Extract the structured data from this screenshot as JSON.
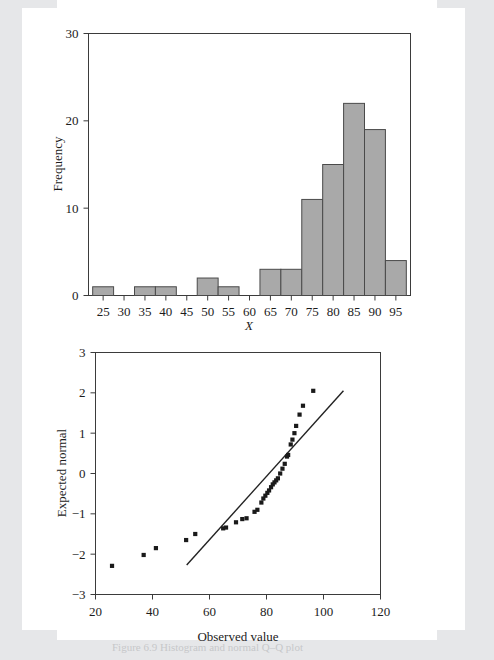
{
  "page": {
    "background_color": "#e6e7e9",
    "figure_background_color": "#ffffff",
    "caption_remnant": "Figure 6.9    Histogram and normal Q–Q plot"
  },
  "chart_data": [
    {
      "id": "histogram",
      "type": "bar",
      "title": "",
      "xlabel": "X",
      "ylabel": "Frequency",
      "categories": [
        25,
        30,
        35,
        40,
        45,
        50,
        55,
        60,
        65,
        70,
        75,
        80,
        85,
        90,
        95
      ],
      "values": [
        1,
        0,
        1,
        1,
        0,
        2,
        1,
        0,
        3,
        3,
        11,
        15,
        22,
        19,
        4
      ],
      "bin_width": 5,
      "xlim": [
        21.5,
        98.5
      ],
      "ylim": [
        0,
        30
      ],
      "xticks": [
        25,
        30,
        35,
        40,
        45,
        50,
        55,
        60,
        65,
        70,
        75,
        80,
        85,
        90,
        95
      ],
      "yticks": [
        0,
        10,
        20,
        30
      ],
      "bar_fill_color": "#a9a9a9",
      "bar_edge_color": "#4a4a4a",
      "grid": false,
      "legend": "none"
    },
    {
      "id": "qq-plot",
      "type": "scatter",
      "title": "",
      "xlabel": "Observed value",
      "ylabel": "Expected normal",
      "xlim": [
        20,
        120
      ],
      "ylim": [
        -3,
        3
      ],
      "xticks": [
        20,
        40,
        60,
        80,
        100,
        120
      ],
      "yticks": [
        -3,
        -2,
        -1,
        0,
        1,
        2,
        3
      ],
      "marker": "square",
      "marker_color": "#1a1a1a",
      "grid": false,
      "legend": "none",
      "points": [
        [
          25.8,
          -2.29
        ],
        [
          36.9,
          -2.02
        ],
        [
          41.2,
          -1.85
        ],
        [
          51.8,
          -1.65
        ],
        [
          55.0,
          -1.5
        ],
        [
          64.8,
          -1.36
        ],
        [
          65.8,
          -1.34
        ],
        [
          69.3,
          -1.21
        ],
        [
          71.5,
          -1.13
        ],
        [
          73.0,
          -1.11
        ],
        [
          75.8,
          -0.95
        ],
        [
          76.8,
          -0.9
        ],
        [
          78.2,
          -0.72
        ],
        [
          78.9,
          -0.62
        ],
        [
          79.6,
          -0.55
        ],
        [
          80.3,
          -0.48
        ],
        [
          80.9,
          -0.42
        ],
        [
          81.6,
          -0.34
        ],
        [
          82.2,
          -0.27
        ],
        [
          82.8,
          -0.22
        ],
        [
          83.4,
          -0.17
        ],
        [
          84.0,
          -0.12
        ],
        [
          84.8,
          0.0
        ],
        [
          85.6,
          0.12
        ],
        [
          86.4,
          0.24
        ],
        [
          87.2,
          0.42
        ],
        [
          87.6,
          0.46
        ],
        [
          88.5,
          0.72
        ],
        [
          89.1,
          0.84
        ],
        [
          89.8,
          1.0
        ],
        [
          90.4,
          1.18
        ],
        [
          91.6,
          1.46
        ],
        [
          92.8,
          1.68
        ],
        [
          96.4,
          2.05
        ]
      ],
      "fit_line": {
        "name": "reference line",
        "x": [
          52.0,
          107.0
        ],
        "y": [
          -2.27,
          2.05
        ],
        "color": "#222222"
      }
    }
  ]
}
